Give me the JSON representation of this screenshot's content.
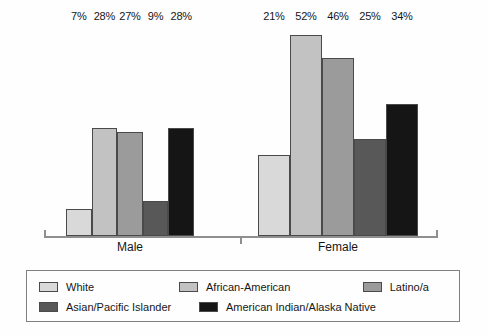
{
  "chart_data": {
    "type": "bar",
    "title": "",
    "subtitle": "",
    "xlabel": "",
    "ylabel": "",
    "ylim": [
      0,
      55
    ],
    "grid": false,
    "value_suffix": "%",
    "legend_position": "bottom",
    "categories": [
      "Male",
      "Female"
    ],
    "series": [
      {
        "name": "White",
        "color": "#d9d9d9",
        "values": [
          7,
          21
        ],
        "labels": [
          "7%",
          "21%"
        ]
      },
      {
        "name": "African-American",
        "color": "#c2c2c2",
        "values": [
          28,
          52
        ],
        "labels": [
          "28%",
          "52%"
        ]
      },
      {
        "name": "Latino/a",
        "color": "#9b9b9b",
        "values": [
          27,
          46
        ],
        "labels": [
          "27%",
          "46%"
        ]
      },
      {
        "name": "Asian/Pacific Islander",
        "color": "#585858",
        "values": [
          9,
          25
        ],
        "labels": [
          "9%",
          "25%"
        ]
      },
      {
        "name": "American Indian/Alaska Native",
        "color": "#151515",
        "values": [
          28,
          34
        ],
        "labels": [
          "28%",
          "34%"
        ]
      }
    ]
  },
  "groups": [
    {
      "label": "Male",
      "bars": [
        {
          "series": "White",
          "label": "7%",
          "value": 7,
          "color": "#d9d9d9"
        },
        {
          "series": "African-American",
          "label": "28%",
          "value": 28,
          "color": "#c2c2c2"
        },
        {
          "series": "Latino/a",
          "label": "27%",
          "value": 27,
          "color": "#9b9b9b"
        },
        {
          "series": "Asian/Pacific Islander",
          "label": "9%",
          "value": 9,
          "color": "#585858"
        },
        {
          "series": "American Indian/Alaska Native",
          "label": "28%",
          "value": 28,
          "color": "#151515"
        }
      ]
    },
    {
      "label": "Female",
      "bars": [
        {
          "series": "White",
          "label": "21%",
          "value": 21,
          "color": "#d9d9d9"
        },
        {
          "series": "African-American",
          "label": "52%",
          "value": 52,
          "color": "#c2c2c2"
        },
        {
          "series": "Latino/a",
          "label": "46%",
          "value": 46,
          "color": "#9b9b9b"
        },
        {
          "series": "Asian/Pacific Islander",
          "label": "25%",
          "value": 25,
          "color": "#585858"
        },
        {
          "series": "American Indian/Alaska Native",
          "label": "34%",
          "value": 34,
          "color": "#151515"
        }
      ]
    }
  ],
  "legend": {
    "rows": [
      [
        {
          "label": "White",
          "color": "#d9d9d9"
        },
        {
          "label": "African-American",
          "color": "#c2c2c2"
        },
        {
          "label": "Latino/a",
          "color": "#9b9b9b"
        }
      ],
      [
        {
          "label": "Asian/Pacific Islander",
          "color": "#585858"
        },
        {
          "label": "American Indian/Alaska Native",
          "color": "#151515"
        }
      ]
    ]
  },
  "scale": {
    "pixels_per_unit": 3.87,
    "baseline_y": 236
  }
}
